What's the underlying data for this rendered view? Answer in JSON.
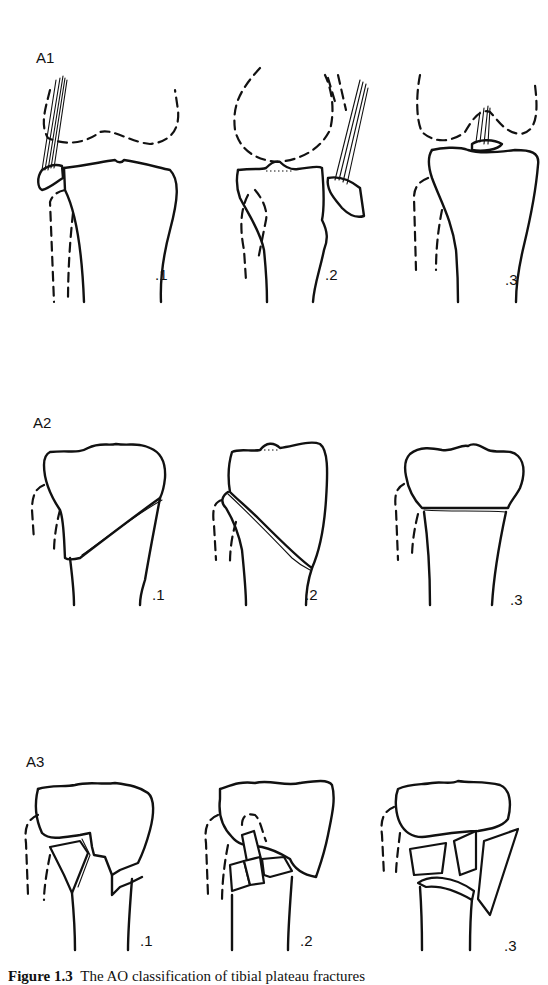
{
  "figure": {
    "rows": [
      {
        "label": "A1",
        "panels": [
          {
            "label": ".1",
            "description": "avulsion of fibular head"
          },
          {
            "label": ".2",
            "description": "avulsion of tibial tuberosity"
          },
          {
            "label": ".3",
            "description": "avulsion of cruciate insertion"
          }
        ]
      },
      {
        "label": "A2",
        "panels": [
          {
            "label": ".1",
            "description": "oblique metaphyseal fracture, frontal plane"
          },
          {
            "label": ".2",
            "description": "oblique metaphyseal fracture, sagittal plane"
          },
          {
            "label": ".3",
            "description": "transverse metaphyseal fracture"
          }
        ]
      },
      {
        "label": "A3",
        "panels": [
          {
            "label": ".1",
            "description": "metaphyseal wedge, intact"
          },
          {
            "label": ".2",
            "description": "metaphyseal wedge, fragmented"
          },
          {
            "label": ".3",
            "description": "metaphyseal complex"
          }
        ]
      }
    ],
    "caption": {
      "number": "Figure 1.3",
      "text": "The AO classification of tibial plateau fractures"
    }
  }
}
